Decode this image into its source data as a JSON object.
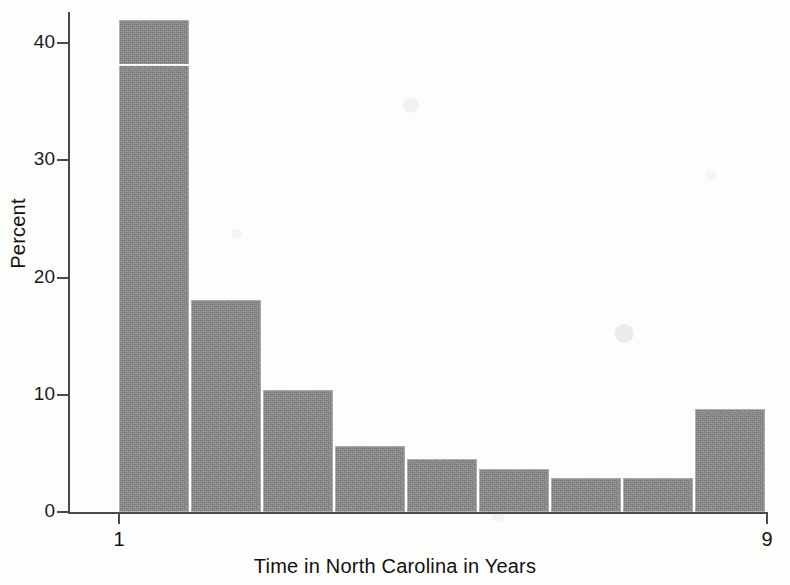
{
  "chart_data": {
    "type": "bar",
    "title": "",
    "subtitle": "",
    "xlabel": "Time in North Carolina in Years",
    "ylabel": "Percent",
    "xlim": [
      1,
      9
    ],
    "ylim": [
      0,
      42.5
    ],
    "grid": false,
    "legend": null,
    "x_tick_labels": [
      "1",
      "9"
    ],
    "x_tick_values": [
      1,
      9
    ],
    "y_tick_labels": [
      "0",
      "10",
      "20",
      "30",
      "40"
    ],
    "y_tick_values": [
      0,
      10,
      20,
      30,
      40
    ],
    "bin_edges": [
      1,
      2,
      3,
      4,
      5,
      6,
      7,
      8,
      9
    ],
    "categories": [
      "1-2",
      "2-3",
      "3-4",
      "4-5",
      "5-6",
      "6-7",
      "7-8",
      "8-9"
    ],
    "values": [
      42.0,
      18.1,
      10.4,
      5.6,
      4.5,
      3.7,
      2.9,
      2.9
    ],
    "bars": [
      {
        "bin": "1-2",
        "left": 1,
        "right": 2,
        "percent": 42.0
      },
      {
        "bin": "2-3",
        "left": 2,
        "right": 3,
        "percent": 18.1
      },
      {
        "bin": "3-4",
        "left": 3,
        "right": 4,
        "percent": 10.4
      },
      {
        "bin": "4-5",
        "left": 4,
        "right": 5,
        "percent": 5.6
      },
      {
        "bin": "5-6",
        "left": 5,
        "right": 6,
        "percent": 4.5
      },
      {
        "bin": "6-7",
        "left": 6,
        "right": 7,
        "percent": 3.7
      },
      {
        "bin": "7-8",
        "left": 7,
        "right": 8,
        "percent": 2.9
      },
      {
        "bin": "8-9",
        "left": 8,
        "right": 9,
        "percent": 2.9
      }
    ],
    "extra_bar_note": "rightmost tall bar",
    "last_bar": {
      "bin": "9+",
      "left": 9,
      "right": 10,
      "percent": 8.8
    },
    "colors": {
      "bar_fill": "#8a8a8a",
      "bar_edge": "#ffffff",
      "axis": "#4a4a4a",
      "text": "#111111",
      "background": "#fdfdfc"
    }
  }
}
